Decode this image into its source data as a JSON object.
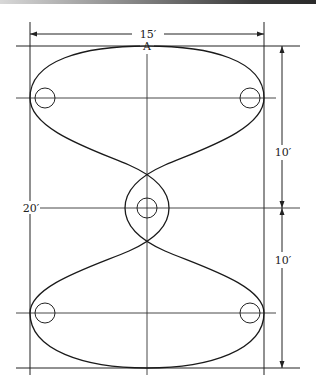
{
  "diagram": {
    "title": "",
    "labels": {
      "width_dimension": "15′",
      "total_height_dimension": "20′",
      "upper_half_dimension": "10′",
      "lower_half_dimension": "10′",
      "point_a": "A"
    },
    "markers": [
      {
        "name": "upper-left"
      },
      {
        "name": "upper-right"
      },
      {
        "name": "center"
      },
      {
        "name": "lower-left"
      },
      {
        "name": "lower-right"
      }
    ],
    "colors": {
      "line": "#222222",
      "background": "#ffffff"
    }
  }
}
